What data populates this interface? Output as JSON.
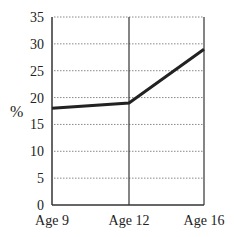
{
  "chart_data": {
    "type": "line",
    "title": "",
    "xlabel": "",
    "ylabel": "%",
    "categories": [
      "Age 9",
      "Age 12",
      "Age 16"
    ],
    "series": [
      {
        "name": "Percentage",
        "values": [
          18,
          19,
          29
        ]
      }
    ],
    "ylim": [
      0,
      35
    ],
    "yticks": [
      "0",
      "5",
      "10",
      "15",
      "20",
      "25",
      "30",
      "35"
    ],
    "grid": {
      "horizontal": "dotted",
      "vertical_at_categories": true
    },
    "legend": null
  },
  "colors": {
    "line": "#222222",
    "axis": "#333333",
    "grid": "#888888"
  }
}
